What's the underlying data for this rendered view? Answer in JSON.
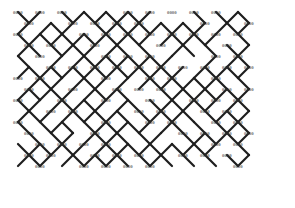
{
  "diagram": {
    "type": "lattice-diagram",
    "background": "#ffffff",
    "stroke_color": "#1e1e1e",
    "label_color": "#333333",
    "node_label": "0000",
    "area": {
      "x0": 18,
      "y0": 12,
      "x1": 252,
      "y1": 172
    },
    "grid": {
      "col_spacing": 22,
      "row_spacing": 11,
      "cols": 11,
      "rows": 15
    },
    "stroke_width": 2.2,
    "top_labels": [
      "0000",
      "0000",
      "0000",
      "0000",
      "0000",
      "0000",
      "0000",
      "0000",
      "0000",
      "0000",
      "0000"
    ]
  }
}
